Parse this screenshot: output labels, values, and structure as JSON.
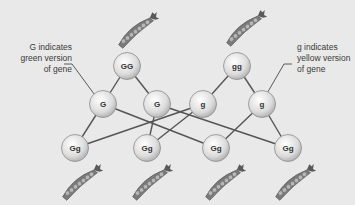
{
  "diagram": {
    "type": "genetic-cross",
    "labels": {
      "left": [
        "G indicates",
        "green version",
        "of gene"
      ],
      "right": [
        "g indicates",
        "yellow version",
        "of gene"
      ]
    },
    "parents": [
      {
        "id": "p1",
        "genotype": "GG",
        "x": 127,
        "y": 66
      },
      {
        "id": "p2",
        "genotype": "gg",
        "x": 237,
        "y": 66
      }
    ],
    "gametes": [
      {
        "id": "a1",
        "allele": "G",
        "x": 103,
        "y": 104
      },
      {
        "id": "a2",
        "allele": "G",
        "x": 157,
        "y": 104
      },
      {
        "id": "a3",
        "allele": "g",
        "x": 203,
        "y": 104
      },
      {
        "id": "a4",
        "allele": "g",
        "x": 262,
        "y": 104
      }
    ],
    "offspring": [
      {
        "id": "o1",
        "genotype": "Gg",
        "x": 75,
        "y": 148
      },
      {
        "id": "o2",
        "genotype": "Gg",
        "x": 147,
        "y": 148
      },
      {
        "id": "o3",
        "genotype": "Gg",
        "x": 216,
        "y": 148
      },
      {
        "id": "o4",
        "genotype": "Gg",
        "x": 288,
        "y": 148
      }
    ],
    "edges": [
      [
        "p1",
        "a1"
      ],
      [
        "p1",
        "a2"
      ],
      [
        "p2",
        "a3"
      ],
      [
        "p2",
        "a4"
      ],
      [
        "a1",
        "o1"
      ],
      [
        "a1",
        "o3"
      ],
      [
        "a2",
        "o2"
      ],
      [
        "a2",
        "o4"
      ],
      [
        "a3",
        "o1"
      ],
      [
        "a3",
        "o2"
      ],
      [
        "a4",
        "o3"
      ],
      [
        "a4",
        "o4"
      ]
    ],
    "pea_pods": [
      {
        "position": "above-GG",
        "x": 138,
        "y": 30
      },
      {
        "position": "above-gg",
        "x": 246,
        "y": 28
      },
      {
        "position": "below-offspring-1",
        "x": 82,
        "y": 182
      },
      {
        "position": "below-offspring-2",
        "x": 152,
        "y": 182
      },
      {
        "position": "below-offspring-3",
        "x": 225,
        "y": 182
      },
      {
        "position": "below-offspring-4",
        "x": 295,
        "y": 182
      }
    ],
    "colors": {
      "background": "#e9e9e9",
      "node_fill": "#e0e0e0",
      "node_stroke": "#8c8c8c",
      "line": "#555555",
      "pod": "#7a7a7a",
      "pea": "#b8b8b8"
    }
  }
}
